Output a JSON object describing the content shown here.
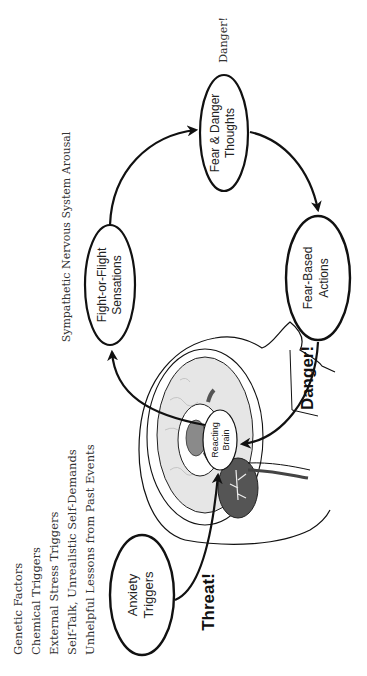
{
  "diagram": {
    "orientation": "rotated -90deg (text reads bottom-to-top)",
    "colors": {
      "line": "#111111",
      "text": "#222222",
      "brain_fill": "#e6e6e6",
      "brain_dark": "#6a6a6a",
      "cerebellum": "#555555",
      "background": "#ffffff"
    },
    "trigger_list": {
      "items": [
        "Genetic Factors",
        "Chemical Triggers",
        "External Stress Triggers",
        "Self-Talk, Unrealistic Self-Demands",
        "Unhelpful Lessons from Past Events"
      ]
    },
    "nodes": {
      "anxiety_triggers": {
        "line1": "Anxiety",
        "line2": "Triggers"
      },
      "reacting_brain": {
        "line1": "Reacting",
        "line2": "Brain"
      },
      "fight_or_flight": {
        "line1": "Fight-or-Flight",
        "line2": "Sensations"
      },
      "fear_danger_thoughts": {
        "line1": "Fear & Danger",
        "line2": "Thoughts"
      },
      "fear_based_actions": {
        "line1": "Fear-Based",
        "line2": "Actions"
      }
    },
    "labels": {
      "threat": "Threat!",
      "danger_bold": "Danger!",
      "danger_small": "Danger!",
      "sympathetic": "Sympathetic Nervous System Arousal"
    }
  }
}
